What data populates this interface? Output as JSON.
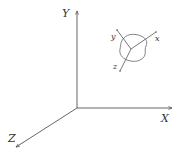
{
  "diagram": {
    "global_axes": {
      "x_label": "X",
      "y_label": "Y",
      "z_label": "Z"
    },
    "local_frame": {
      "x_label": "x",
      "y_label": "y",
      "z_label": "z"
    },
    "colors": {
      "line": "#555555",
      "text": "#333333",
      "background": "#ffffff"
    }
  }
}
